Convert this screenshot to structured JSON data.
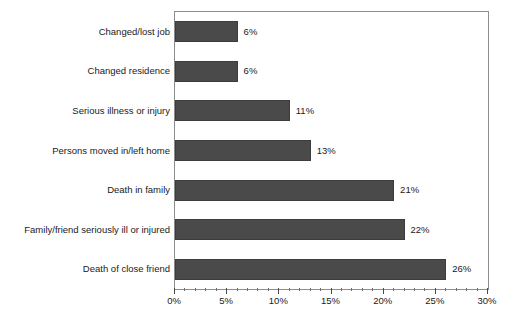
{
  "chart_data": {
    "type": "bar",
    "orientation": "horizontal",
    "title": "",
    "subtitle": "",
    "xlabel": "",
    "ylabel": "",
    "xlim": [
      0,
      30
    ],
    "xunit": "%",
    "grid": false,
    "legend": null,
    "bar_color": "#4a4a4a",
    "frame_color": "#8d8d8d",
    "categories": [
      "Changed/lost job",
      "Changed residence",
      "Serious illness or injury",
      "Persons moved in/left home",
      "Death in family",
      "Family/friend seriously ill or injured",
      "Death of close friend"
    ],
    "values": [
      6,
      6,
      11,
      13,
      21,
      22,
      26
    ],
    "value_labels": [
      "6%",
      "6%",
      "11%",
      "13%",
      "21%",
      "22%",
      "26%"
    ],
    "xticks": [
      0,
      5,
      10,
      15,
      20,
      25,
      30
    ],
    "xtick_labels": [
      "0%",
      "5%",
      "10%",
      "15%",
      "20%",
      "25%",
      "30%"
    ],
    "minor_tick_step": 1
  }
}
